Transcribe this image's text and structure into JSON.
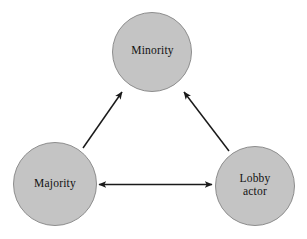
{
  "diagram": {
    "type": "triad-relationship-diagram",
    "background_color": "#ffffff",
    "node_fill_color": "#c4c4c4",
    "node_stroke_color": "#8d8d8d",
    "arrow_color": "#1a1a1a",
    "text_color": "#121212",
    "nodes": [
      {
        "id": "minority",
        "label": "Minority",
        "shape": "circle",
        "cx": 152,
        "cy": 52,
        "r": 40
      },
      {
        "id": "majority",
        "label": "Majority",
        "shape": "circle",
        "cx": 55,
        "cy": 184,
        "r": 42
      },
      {
        "id": "lobby-actor",
        "label": "Lobby\nactor",
        "shape": "circle",
        "cx": 255,
        "cy": 186,
        "r": 40
      }
    ],
    "edges": [
      {
        "id": "majority-to-minority",
        "from": "majority",
        "to": "minority",
        "direction": "single",
        "arrowheads": "end"
      },
      {
        "id": "lobby-actor-to-minority",
        "from": "lobby-actor",
        "to": "minority",
        "direction": "single",
        "arrowheads": "end"
      },
      {
        "id": "majority-lobby-actor",
        "from": "majority",
        "to": "lobby-actor",
        "direction": "bidirectional",
        "arrowheads": "both"
      }
    ]
  }
}
